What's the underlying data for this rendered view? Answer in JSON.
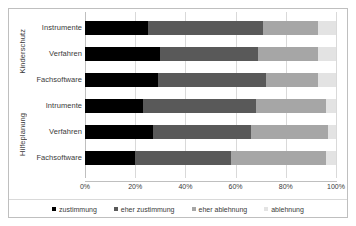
{
  "chart_data": {
    "type": "bar",
    "orientation": "horizontal",
    "stacked": true,
    "normalized_percent": true,
    "title": "",
    "xlabel": "",
    "ylabel": "",
    "xlim": [
      0,
      100
    ],
    "grid": true,
    "legend_position": "bottom",
    "axis_ticks": [
      "0%",
      "20%",
      "40%",
      "60%",
      "80%",
      "100%"
    ],
    "axis_tick_values": [
      0,
      20,
      40,
      60,
      80,
      100
    ],
    "series": [
      {
        "name": "zustimmung",
        "color": "#000000",
        "values": [
          25,
          30,
          29,
          23,
          27,
          20
        ]
      },
      {
        "name": "eher zustimmung",
        "color": "#595959",
        "values": [
          46,
          39,
          43,
          45,
          39,
          38
        ]
      },
      {
        "name": "eher ablehnung",
        "color": "#a6a6a6",
        "values": [
          22,
          24,
          21,
          28,
          31,
          38
        ]
      },
      {
        "name": "ablehnung",
        "color": "#e3e3e3",
        "values": [
          7,
          7,
          7,
          4,
          3,
          4
        ]
      }
    ],
    "categories": [
      "Instrumente",
      "Verfahren",
      "Fachsoftware",
      "Intrumente",
      "Verfahren",
      "Fachsoftware"
    ],
    "groups": [
      {
        "label": "Kinderschutz",
        "categories": [
          "Instrumente",
          "Verfahren",
          "Fachsoftware"
        ]
      },
      {
        "label": "Hilfeplanung",
        "categories": [
          "Intrumente",
          "Verfahren",
          "Fachsoftware"
        ]
      }
    ]
  },
  "legend": {
    "items": [
      {
        "label": "zustimmung",
        "color": "#000000"
      },
      {
        "label": "eher zustimmung",
        "color": "#595959"
      },
      {
        "label": "eher ablehnung",
        "color": "#a6a6a6"
      },
      {
        "label": "ablehnung",
        "color": "#e3e3e3"
      }
    ]
  }
}
